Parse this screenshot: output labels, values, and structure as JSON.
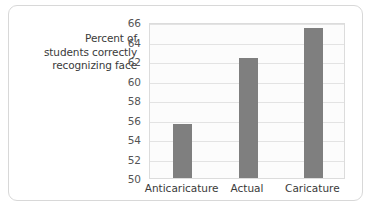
{
  "chart_data": {
    "type": "bar",
    "title": "",
    "xlabel": "",
    "ylabel": "Percent of students correctly recognizing face",
    "ylabel_lines": [
      "Percent of",
      "students correctly",
      "recognizing face"
    ],
    "categories": [
      "Anticaricature",
      "Actual",
      "Caricature"
    ],
    "values": [
      55.5,
      62.3,
      65.4
    ],
    "ylim": [
      50,
      66
    ],
    "yticks": [
      50,
      52,
      54,
      56,
      58,
      60,
      62,
      64,
      66
    ],
    "ytick_labels": [
      "50",
      "52",
      "54",
      "56",
      "58",
      "60",
      "62",
      "64",
      "66"
    ],
    "grid": true,
    "grid_axis": "y",
    "legend": false,
    "legend_position": "none",
    "bar_color": "#7f7f7f",
    "plot_background": "#fcfcfc",
    "grid_color": "#e3e3e3",
    "axis_border_color": "#dcdcdc",
    "frame_color": "#d8d8d8"
  }
}
